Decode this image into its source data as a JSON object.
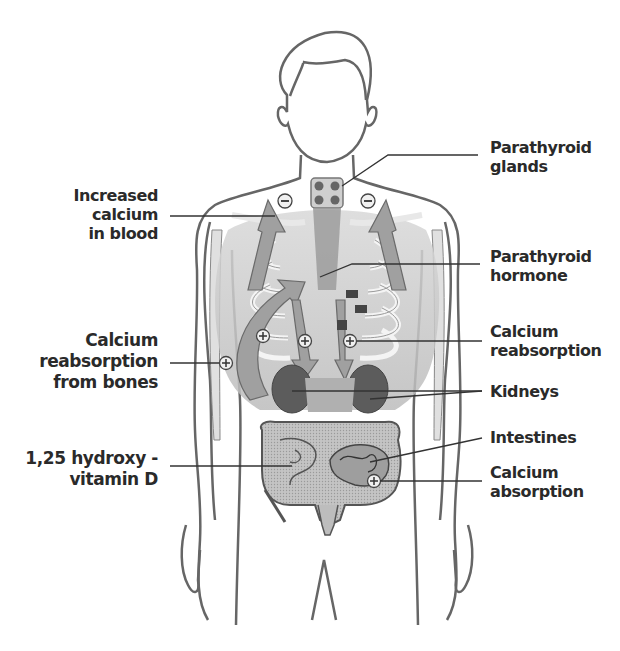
{
  "diagram": {
    "labels_left": [
      {
        "id": "increased-calcium",
        "lines": [
          "Increased",
          "calcium",
          "in blood"
        ]
      },
      {
        "id": "calcium-reabsorption-bones",
        "lines": [
          "Calcium",
          "reabsorption",
          "from bones"
        ]
      },
      {
        "id": "vitamin-d",
        "lines": [
          "1,25 hydroxy -",
          "vitamin D"
        ]
      }
    ],
    "labels_right": [
      {
        "id": "parathyroid-glands",
        "lines": [
          "Parathyroid",
          "glands"
        ]
      },
      {
        "id": "parathyroid-hormone",
        "lines": [
          "Parathyroid",
          "hormone"
        ]
      },
      {
        "id": "calcium-reabsorption",
        "lines": [
          "Calcium",
          "reabsorption"
        ]
      },
      {
        "id": "kidneys",
        "lines": [
          "Kidneys"
        ]
      },
      {
        "id": "intestines",
        "lines": [
          "Intestines"
        ]
      },
      {
        "id": "calcium-absorption",
        "lines": [
          "Calcium",
          "absorption"
        ]
      }
    ],
    "symbols": {
      "minus": "−",
      "plus": "+"
    },
    "colors": {
      "outline": "#555555",
      "arrow_fill": "#a8a8a8",
      "organ_dark": "#5a5a5a",
      "intestine_fill": "#b5b5b5",
      "text": "#2a2a2a"
    }
  }
}
